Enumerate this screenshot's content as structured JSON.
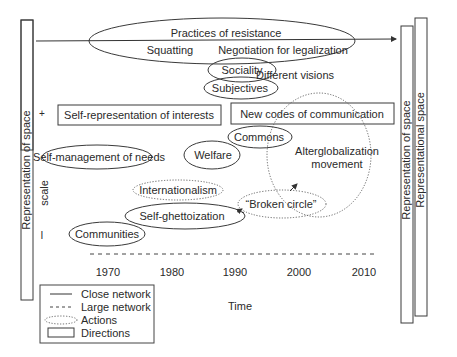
{
  "diagram": {
    "left_bar_label": "Representation of space",
    "right_bars": [
      {
        "label": "Representation of space"
      },
      {
        "label": "Representational space"
      }
    ],
    "scale": {
      "label": "scale",
      "plus": "+",
      "minus": "I"
    },
    "top": {
      "title": "Practices of resistance",
      "sub_left": "Squatting",
      "sub_right": "Negotiation for legalization"
    },
    "nodes": {
      "sociality": "Sociality",
      "subjectives": "Subjectives",
      "different_visions": "Different visions",
      "self_representation": "Self-representation of interests",
      "new_codes": "New codes of communication",
      "commons": "Commons",
      "self_management": "Self-management of needs",
      "welfare": "Welfare",
      "alterglobalization_line1": "Alterglobalization",
      "alterglobalization_line2": "movement",
      "internationalism": "Internationalism",
      "self_ghettoization": "Self-ghettoization",
      "broken_circle": "“Broken circle”",
      "communities": "Communities"
    },
    "x_axis": {
      "ticks": [
        "1970",
        "1980",
        "1990",
        "2000",
        "2010"
      ],
      "label": "Time"
    },
    "legend": {
      "items": [
        {
          "symbol": "solid-line",
          "label": "Close network"
        },
        {
          "symbol": "dashed-line",
          "label": "Large network"
        },
        {
          "symbol": "dotted-ellipse",
          "label": "Actions"
        },
        {
          "symbol": "rectangle",
          "label": "Directions"
        }
      ]
    }
  }
}
